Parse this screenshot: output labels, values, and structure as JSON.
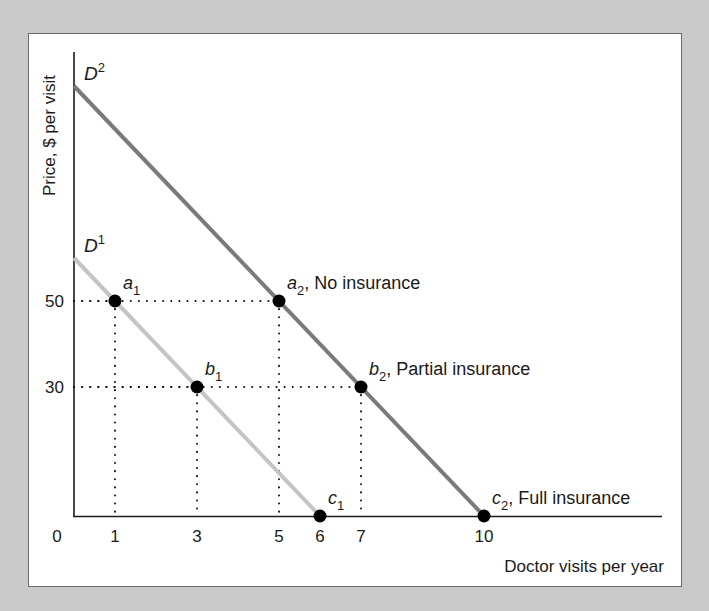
{
  "chart_data": {
    "type": "line",
    "title": "",
    "xlabel": "Doctor visits per year",
    "ylabel": "Price, $ per visit",
    "xlim": [
      0,
      14
    ],
    "ylim": [
      0,
      108
    ],
    "x_ticks": [
      "0",
      "1",
      "3",
      "5",
      "6",
      "7",
      "10"
    ],
    "y_ticks": [
      "50",
      "30"
    ],
    "grid": false,
    "series": [
      {
        "name": "D1",
        "label_main": "D",
        "label_sup": "1",
        "color": "#c4c4c4",
        "points": [
          [
            0,
            60
          ],
          [
            1,
            50
          ],
          [
            3,
            30
          ],
          [
            6,
            0
          ]
        ]
      },
      {
        "name": "D2",
        "label_main": "D",
        "label_sup": "2",
        "color": "#7a7a7a",
        "points": [
          [
            0,
            100
          ],
          [
            5,
            50
          ],
          [
            7,
            30
          ],
          [
            10,
            0
          ]
        ]
      }
    ],
    "points": [
      {
        "id": "a1",
        "letter": "a",
        "sub": "1",
        "text": "",
        "x": 1,
        "y": 50
      },
      {
        "id": "b1",
        "letter": "b",
        "sub": "1",
        "text": "",
        "x": 3,
        "y": 30
      },
      {
        "id": "c1",
        "letter": "c",
        "sub": "1",
        "text": "",
        "x": 6,
        "y": 0
      },
      {
        "id": "a2",
        "letter": "a",
        "sub": "2",
        "text": ", No insurance",
        "x": 5,
        "y": 50
      },
      {
        "id": "b2",
        "letter": "b",
        "sub": "2",
        "text": ", Partial insurance",
        "x": 7,
        "y": 30
      },
      {
        "id": "c2",
        "letter": "c",
        "sub": "2",
        "text": ", Full insurance",
        "x": 10,
        "y": 0
      }
    ],
    "annotations": [
      "a1",
      "b1",
      "c1",
      "a2, No insurance",
      "b2, Partial insurance",
      "c2, Full insurance"
    ]
  },
  "colors": {
    "background": "#c9c9c9",
    "panel": "#ffffff",
    "axis": "#1a1a1a",
    "d1": "#c4c4c4",
    "d2": "#7a7a7a",
    "dots": "#000000"
  }
}
